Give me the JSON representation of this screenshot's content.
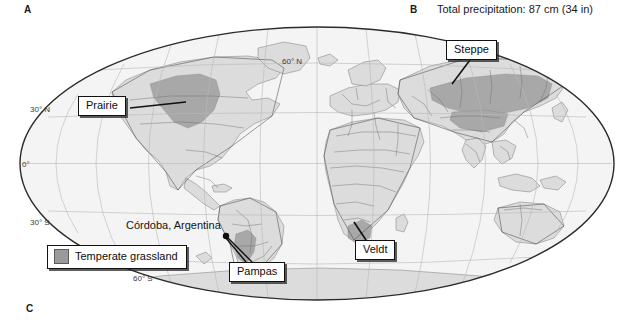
{
  "figure": {
    "panels": [
      {
        "letter": "A",
        "caption": ""
      },
      {
        "letter": "B",
        "caption": "Total precipitation: 87 cm (34 in)"
      },
      {
        "letter": "C",
        "caption": ""
      }
    ]
  },
  "map": {
    "projection": "mollweide-oval",
    "latitude_labels": [
      {
        "text": "60° N",
        "x": 282,
        "y": 64
      },
      {
        "text": "30° N",
        "x": 30,
        "y": 112
      },
      {
        "text": "0°",
        "x": 22,
        "y": 167
      },
      {
        "text": "30° S",
        "x": 30,
        "y": 225
      },
      {
        "text": "60° S",
        "x": 133,
        "y": 281
      }
    ],
    "colors": {
      "ocean": "#f4f4f4",
      "land": "#dcdcdc",
      "grassland": "#a8a8a8",
      "border": "#6e6e6e",
      "coastline": "#4a4a4a",
      "graticule": "#b9b9b9",
      "outline": "#2b2b2b"
    }
  },
  "callouts": [
    {
      "id": "prairie",
      "label": "Prairie"
    },
    {
      "id": "steppe",
      "label": "Steppe"
    },
    {
      "id": "pampas",
      "label": "Pampas"
    },
    {
      "id": "veldt",
      "label": "Veldt"
    }
  ],
  "legend": {
    "label": "Temperate grassland",
    "swatch_color": "#9a9a9a"
  },
  "city_marker": {
    "label": "Córdoba, Argentina",
    "x": 226,
    "y": 236
  }
}
